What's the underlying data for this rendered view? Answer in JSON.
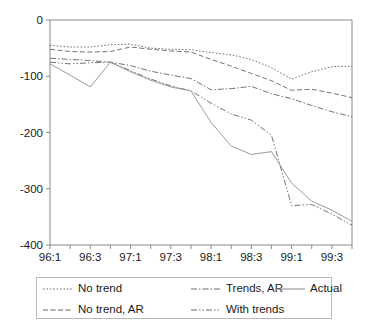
{
  "chart_data": {
    "type": "line",
    "title": "",
    "xlabel": "",
    "ylabel": "",
    "ylim": [
      -400,
      0
    ],
    "grid": false,
    "legend_position": "bottom",
    "x": [
      "96:1",
      "96:2",
      "96:3",
      "96:4",
      "97:1",
      "97:2",
      "97:3",
      "97:4",
      "98:1",
      "98:2",
      "98:3",
      "98:4",
      "99:1",
      "99:2",
      "99:3",
      "99:4"
    ],
    "xtick_labels": [
      "96:1",
      "96:3",
      "97:1",
      "97:3",
      "98:1",
      "98:3",
      "99:1",
      "99:3"
    ],
    "ytick_labels": [
      "0",
      "-100",
      "-200",
      "-300",
      "-400"
    ],
    "ytick_values": [
      0,
      -100,
      -200,
      -300,
      -400
    ],
    "series": [
      {
        "name": "No trend",
        "style": "dotted",
        "values": [
          -45,
          -48,
          -48,
          -44,
          -43,
          -50,
          -52,
          -53,
          -58,
          -62,
          -70,
          -85,
          -105,
          -92,
          -83,
          -82
        ]
      },
      {
        "name": "No trend, AR",
        "style": "dashed",
        "values": [
          -52,
          -56,
          -57,
          -56,
          -48,
          -52,
          -55,
          -57,
          -70,
          -82,
          -95,
          -108,
          -125,
          -123,
          -130,
          -138
        ]
      },
      {
        "name": "Trends, AR",
        "style": "dash-dot",
        "values": [
          -68,
          -70,
          -72,
          -75,
          -81,
          -91,
          -98,
          -104,
          -124,
          -122,
          -118,
          -131,
          -140,
          -152,
          -163,
          -172
        ]
      },
      {
        "name": "With trends",
        "style": "dash-dot-dot",
        "values": [
          -75,
          -78,
          -76,
          -75,
          -90,
          -105,
          -117,
          -126,
          -148,
          -167,
          -178,
          -205,
          -330,
          -328,
          -345,
          -365
        ]
      },
      {
        "name": "Actual",
        "style": "solid",
        "values": [
          -78,
          -98,
          -119,
          -75,
          -92,
          -107,
          -119,
          -126,
          -182,
          -224,
          -239,
          -234,
          -290,
          -322,
          -338,
          -358
        ]
      }
    ]
  },
  "legend": {
    "rows": [
      [
        {
          "label": "No trend",
          "style": "dotted"
        },
        {
          "label": "Trends, AR",
          "style": "dash-dot"
        },
        {
          "label": "Actual",
          "style": "solid"
        }
      ],
      [
        {
          "label": "No trend, AR",
          "style": "dashed"
        },
        {
          "label": "With trends",
          "style": "dash-dot-dot"
        }
      ]
    ]
  },
  "colors": {
    "axis": "#8a8a8a",
    "line": "#6b6b6b",
    "solid_line": "#9a9a9a",
    "text": "#1a1a1a",
    "legend_border": "#b8b8b8",
    "background": "#ffffff"
  }
}
